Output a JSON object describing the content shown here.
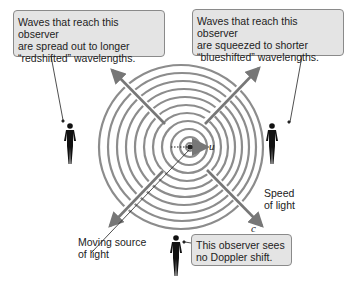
{
  "callouts": {
    "redshift": {
      "line1": "Waves that reach this observer",
      "line2": "are spread out to longer",
      "line3": "“redshifted” wavelengths."
    },
    "blueshift": {
      "line1": "Waves that reach this observer",
      "line2": "are squeezed to shorter",
      "line3": "“blueshifted” wavelengths."
    },
    "no_shift": {
      "line1": "This observer sees",
      "line2": "no Doppler shift."
    }
  },
  "labels": {
    "source": {
      "line1": "Moving source",
      "line2": "of light"
    },
    "speed": {
      "line1": "Speed",
      "line2": "of light"
    },
    "velocity_symbol": "u",
    "light_speed_symbol": "c"
  },
  "colors": {
    "wavefront": "#8c8c8c",
    "arrow": "#7a7a7a",
    "callout_bg": "#e4e4e4",
    "figure": "#111111"
  }
}
